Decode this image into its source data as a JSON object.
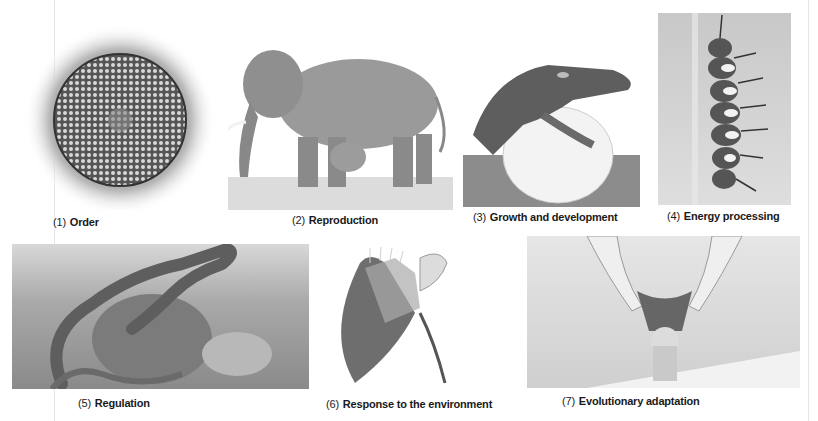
{
  "figure": {
    "panels": [
      {
        "number": "(1)",
        "label": "Order",
        "subject": "sunflower-head"
      },
      {
        "number": "(2)",
        "label": "Reproduction",
        "subject": "elephant-with-calf"
      },
      {
        "number": "(3)",
        "label": "Growth and development",
        "subject": "crocodile-hatching"
      },
      {
        "number": "(4)",
        "label": "Energy processing",
        "subject": "caterpillar-on-stem"
      },
      {
        "number": "(5)",
        "label": "Regulation",
        "subject": "lizard-on-rock"
      },
      {
        "number": "(6)",
        "label": "Response to the environment",
        "subject": "venus-flytrap"
      },
      {
        "number": "(7)",
        "label": "Evolutionary adaptation",
        "subject": "owl-in-flight"
      }
    ]
  }
}
